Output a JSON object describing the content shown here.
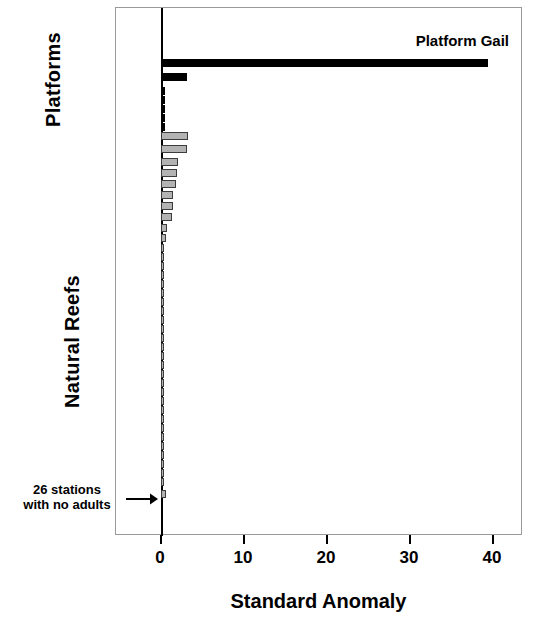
{
  "figure": {
    "title": "",
    "axis_labels": {
      "platforms": "Platforms",
      "natural_reefs": "Natural Reefs",
      "xaxis_title": "Standard Anomaly"
    },
    "annotations": {
      "platform_gail": "Platform Gail",
      "no_adults_line1": "26 stations",
      "no_adults_line2": "with no adults",
      "arrow_icon": "right-arrow-icon"
    },
    "colors": {
      "platform_bar": "#000000",
      "reef_bar_fill": "#b3b3b3",
      "reef_bar_edge": "#3c3c3c",
      "axis": "#000000",
      "frame": "#9a9a9a",
      "background": "#ffffff"
    }
  },
  "chart_data": {
    "type": "bar",
    "orientation": "horizontal",
    "title": "",
    "xlabel": "Standard Anomaly",
    "ylabel": "",
    "xlim": [
      -1.9,
      47.0
    ],
    "xticks": [
      0,
      10,
      20,
      30,
      40
    ],
    "xticklabels": [
      "0",
      "10",
      "20",
      "30",
      "40"
    ],
    "grid": false,
    "legend": null,
    "notes": [
      "Bars sorted in descending order of standard anomaly.",
      "Black bars = Platforms, grey bars = Natural Reefs.",
      "26 stations at the bottom have no adults (values at or near zero)."
    ],
    "annotations": [
      {
        "text": "Platform Gail",
        "points_to_bar_index": 0,
        "value": 39.4
      },
      {
        "text": "26 stations with no adults",
        "points_to_bar_index": 44,
        "arrow": "right"
      }
    ],
    "series": [
      {
        "name": "Platforms",
        "color": "#000000",
        "categories": [
          "Platform Gail",
          "Platform 2",
          "Platform 3",
          "Platform 4",
          "Platform 5",
          "Platform 6",
          "Platform 7"
        ],
        "values": [
          39.4,
          3.1,
          0.5,
          0.5,
          0.5,
          0.5,
          0.5
        ]
      },
      {
        "name": "Natural Reefs",
        "color": "#b3b3b3",
        "categories": [
          "Reef 1",
          "Reef 2",
          "Reef 3",
          "Reef 4",
          "Reef 5",
          "Reef 6",
          "Reef 7",
          "Reef 8",
          "Reef 9",
          "Reef 10",
          "Reef 11",
          "Reef 12",
          "Reef 13",
          "Reef 14",
          "Reef 15",
          "Reef 16",
          "Reef 17",
          "Reef 18",
          "Reef 19",
          "Reef 20",
          "Reef 21",
          "Reef 22",
          "Reef 23",
          "Reef 24",
          "Reef 25",
          "Reef 26",
          "Reef 27",
          "Reef 28",
          "Reef 29",
          "Reef 30",
          "Reef 31",
          "Reef 32",
          "Reef 33",
          "Reef 34",
          "Reef 35",
          "Reef 36",
          "Reef 37",
          "Reef 38"
        ],
        "values": [
          3.3,
          3.1,
          2.0,
          1.9,
          1.8,
          1.5,
          1.4,
          1.3,
          0.7,
          0.6,
          0.4,
          0.25,
          0.2,
          0.15,
          0.12,
          0.1,
          0.1,
          0.1,
          0.1,
          0.1,
          0.12,
          0.15,
          0.15,
          0.18,
          0.2,
          0.2,
          0.22,
          0.25,
          0.25,
          0.28,
          0.3,
          0.3,
          0.3,
          0.32,
          0.35,
          0.35,
          0.4,
          0.55
        ]
      }
    ],
    "bars": [
      {
        "group": "Platforms",
        "value": 39.4,
        "y": 58
      },
      {
        "group": "Platforms",
        "value": 3.1,
        "y": 72
      },
      {
        "group": "Platforms",
        "value": 0.5,
        "y": 86
      },
      {
        "group": "Platforms",
        "value": 0.5,
        "y": 95
      },
      {
        "group": "Platforms",
        "value": 0.5,
        "y": 104
      },
      {
        "group": "Platforms",
        "value": 0.5,
        "y": 113
      },
      {
        "group": "Platforms",
        "value": 0.5,
        "y": 122
      },
      {
        "group": "Natural Reefs",
        "value": 3.3,
        "y": 131
      },
      {
        "group": "Natural Reefs",
        "value": 3.1,
        "y": 144
      },
      {
        "group": "Natural Reefs",
        "value": 2.0,
        "y": 157
      },
      {
        "group": "Natural Reefs",
        "value": 1.9,
        "y": 168
      },
      {
        "group": "Natural Reefs",
        "value": 1.8,
        "y": 179
      },
      {
        "group": "Natural Reefs",
        "value": 1.5,
        "y": 190
      },
      {
        "group": "Natural Reefs",
        "value": 1.4,
        "y": 201
      },
      {
        "group": "Natural Reefs",
        "value": 1.3,
        "y": 212
      },
      {
        "group": "Natural Reefs",
        "value": 0.7,
        "y": 223
      },
      {
        "group": "Natural Reefs",
        "value": 0.6,
        "y": 233
      },
      {
        "group": "Natural Reefs",
        "value": 0.4,
        "y": 243
      },
      {
        "group": "Natural Reefs",
        "value": 0.25,
        "y": 252
      },
      {
        "group": "Natural Reefs",
        "value": 0.2,
        "y": 261
      },
      {
        "group": "Natural Reefs",
        "value": 0.15,
        "y": 270
      },
      {
        "group": "Natural Reefs",
        "value": 0.12,
        "y": 279
      },
      {
        "group": "Natural Reefs",
        "value": 0.1,
        "y": 288
      },
      {
        "group": "Natural Reefs",
        "value": 0.1,
        "y": 297
      },
      {
        "group": "Natural Reefs",
        "value": 0.1,
        "y": 306
      },
      {
        "group": "Natural Reefs",
        "value": 0.1,
        "y": 315
      },
      {
        "group": "Natural Reefs",
        "value": 0.1,
        "y": 324
      },
      {
        "group": "Natural Reefs",
        "value": 0.12,
        "y": 333
      },
      {
        "group": "Natural Reefs",
        "value": 0.15,
        "y": 342
      },
      {
        "group": "Natural Reefs",
        "value": 0.15,
        "y": 351
      },
      {
        "group": "Natural Reefs",
        "value": 0.18,
        "y": 360
      },
      {
        "group": "Natural Reefs",
        "value": 0.2,
        "y": 369
      },
      {
        "group": "Natural Reefs",
        "value": 0.2,
        "y": 378
      },
      {
        "group": "Natural Reefs",
        "value": 0.22,
        "y": 387
      },
      {
        "group": "Natural Reefs",
        "value": 0.25,
        "y": 396
      },
      {
        "group": "Natural Reefs",
        "value": 0.25,
        "y": 405
      },
      {
        "group": "Natural Reefs",
        "value": 0.28,
        "y": 414
      },
      {
        "group": "Natural Reefs",
        "value": 0.3,
        "y": 423
      },
      {
        "group": "Natural Reefs",
        "value": 0.3,
        "y": 432
      },
      {
        "group": "Natural Reefs",
        "value": 0.3,
        "y": 441
      },
      {
        "group": "Natural Reefs",
        "value": 0.32,
        "y": 450
      },
      {
        "group": "Natural Reefs",
        "value": 0.35,
        "y": 459
      },
      {
        "group": "Natural Reefs",
        "value": 0.35,
        "y": 468
      },
      {
        "group": "Natural Reefs",
        "value": 0.4,
        "y": 477
      },
      {
        "group": "Natural Reefs",
        "value": 0.55,
        "y": 489
      }
    ]
  }
}
